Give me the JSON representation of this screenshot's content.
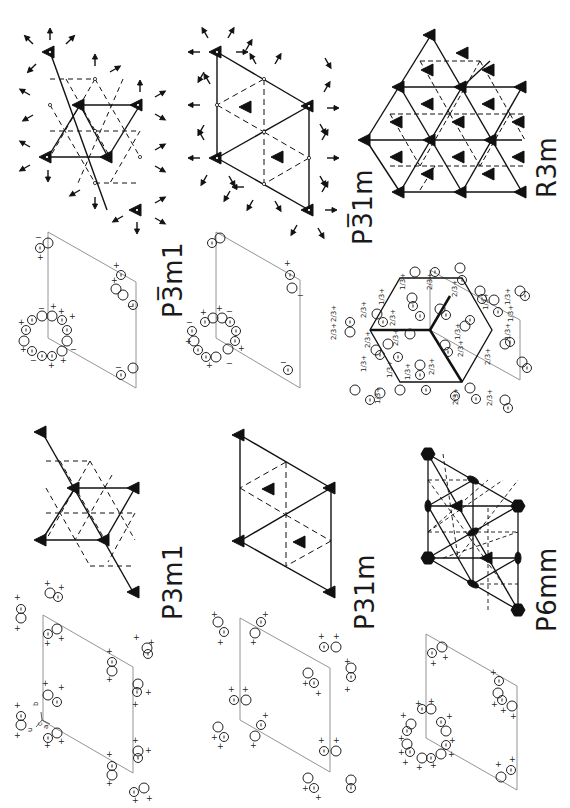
{
  "figure": {
    "orientation": "rotated 90 degrees counter-clockwise",
    "panels": [
      {
        "id": "p3m1",
        "label": "P3m1",
        "position": "bottom-left"
      },
      {
        "id": "p-3m1",
        "label": "P3̅m1",
        "position": "top-left"
      },
      {
        "id": "p31m",
        "label": "P31m",
        "position": "bottom-center"
      },
      {
        "id": "p-31m",
        "label": "P3̅1m",
        "position": "top-center"
      },
      {
        "id": "p6mm",
        "label": "P6mm",
        "position": "bottom-right"
      },
      {
        "id": "r3m",
        "label": "R3m",
        "position": "top-right"
      }
    ],
    "axis_labels": {
      "a": "a",
      "b": "b",
      "c": "c",
      "u": "u"
    },
    "equipoint_marks": {
      "plus": "+",
      "minus": "−",
      "comma": ","
    },
    "fractional_heights": [
      "1/3+",
      "2/3+",
      "1/3",
      "2/3"
    ],
    "colors": {
      "ink": "#1a1a1a",
      "cell_line": "#777777",
      "background": "#ffffff"
    }
  }
}
